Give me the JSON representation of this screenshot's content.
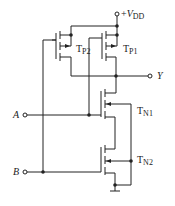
{
  "diagram": {
    "type": "CMOS NOR gate schematic",
    "supply": {
      "prefix": "+",
      "symbol": "V",
      "subscript": "DD"
    },
    "output": {
      "label": "Y"
    },
    "inputs": [
      {
        "label": "A"
      },
      {
        "label": "B"
      }
    ],
    "transistors": [
      {
        "id": "TP2",
        "base": "T",
        "subscript": "P2",
        "type": "PMOS"
      },
      {
        "id": "TP1",
        "base": "T",
        "subscript": "P1",
        "type": "PMOS"
      },
      {
        "id": "TN1",
        "base": "T",
        "subscript": "N1",
        "type": "NMOS"
      },
      {
        "id": "TN2",
        "base": "T",
        "subscript": "N2",
        "type": "NMOS"
      }
    ],
    "ground": "ground-symbol",
    "colors": {
      "line": "#222222",
      "background": "#ffffff"
    }
  }
}
